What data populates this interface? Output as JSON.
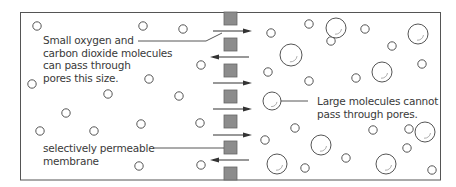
{
  "diagram": {
    "colors": {
      "border": "#555555",
      "membrane_fill": "#8c8c8c",
      "membrane_stroke": "#666666",
      "arrow": "#333333",
      "molecule_stroke": "#555555",
      "text": "#3a3a3a"
    },
    "labels": {
      "small_molecules": [
        "Small oxygen and",
        "carbon dioxide molecules",
        "can pass through",
        "pores this size."
      ],
      "large_molecules": [
        "Large molecules cannot",
        "pass through pores."
      ],
      "membrane": [
        "selectively permeable",
        "membrane"
      ]
    },
    "membrane": {
      "x": 224,
      "width": 13,
      "height": 13,
      "segments_y": [
        12,
        38,
        64,
        90,
        115,
        141,
        167
      ]
    },
    "arrows": [
      {
        "y": 31,
        "direction": "right"
      },
      {
        "y": 57,
        "direction": "left"
      },
      {
        "y": 83,
        "direction": "right"
      },
      {
        "y": 109,
        "direction": "right"
      },
      {
        "y": 135,
        "direction": "right"
      },
      {
        "y": 160,
        "direction": "left"
      }
    ],
    "small_molecules": [
      [
        37,
        26
      ],
      [
        143,
        26
      ],
      [
        183,
        29
      ],
      [
        201,
        65
      ],
      [
        32,
        84
      ],
      [
        149,
        79
      ],
      [
        108,
        94
      ],
      [
        179,
        96
      ],
      [
        66,
        113
      ],
      [
        40,
        131
      ],
      [
        94,
        131
      ],
      [
        141,
        124
      ],
      [
        200,
        123
      ],
      [
        139,
        166
      ],
      [
        201,
        165
      ],
      [
        271,
        33
      ],
      [
        309,
        24
      ],
      [
        331,
        41
      ],
      [
        268,
        72
      ],
      [
        309,
        81
      ],
      [
        365,
        29
      ],
      [
        392,
        46
      ],
      [
        422,
        64
      ],
      [
        356,
        78
      ],
      [
        265,
        140
      ],
      [
        295,
        128
      ],
      [
        346,
        158
      ],
      [
        373,
        130
      ],
      [
        409,
        129
      ],
      [
        407,
        148
      ],
      [
        432,
        170
      ],
      [
        305,
        168
      ]
    ],
    "large_molecules": [
      [
        336,
        28,
        10
      ],
      [
        291,
        55,
        11
      ],
      [
        418,
        34,
        10
      ],
      [
        382,
        72,
        10
      ],
      [
        272,
        101,
        9
      ],
      [
        321,
        145,
        10
      ],
      [
        425,
        132,
        10
      ],
      [
        277,
        164,
        10
      ],
      [
        386,
        164,
        10
      ]
    ]
  }
}
